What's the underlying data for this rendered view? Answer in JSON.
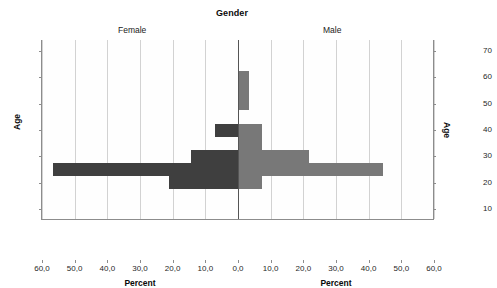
{
  "chart_data": {
    "type": "bar",
    "title": "Gender",
    "subtype": "population-pyramid",
    "panels": [
      {
        "name": "female",
        "label": "Female",
        "side": "left",
        "color": "#3f3f3f"
      },
      {
        "name": "male",
        "label": "Male",
        "side": "right",
        "color": "#787878"
      }
    ],
    "xlabel": "Percent",
    "ylabel": "Age",
    "xlabel_left": "Percent",
    "xlabel_right": "Percent",
    "ylabel_left": "Age",
    "ylabel_right": "Age",
    "xlim": [
      0,
      60
    ],
    "ylim": [
      10,
      70
    ],
    "grid": true,
    "legend_position": "none",
    "decimal_separator": ",",
    "xticks_left": [
      "60,0",
      "50,0",
      "40,0",
      "30,0",
      "20,0",
      "10,0",
      "0,0"
    ],
    "xticks_right": [
      "0,0",
      "10,0",
      "20,0",
      "30,0",
      "40,0",
      "50,0",
      "60,0"
    ],
    "xtick_values_left": [
      60,
      50,
      40,
      30,
      20,
      10,
      0
    ],
    "xtick_values_right": [
      0,
      10,
      20,
      30,
      40,
      50,
      60
    ],
    "yticks": [
      "70",
      "60",
      "50",
      "40",
      "30",
      "20",
      "10"
    ],
    "ytick_values": [
      70,
      60,
      50,
      40,
      30,
      20,
      10
    ],
    "series": [
      {
        "name": "Female",
        "side": "left",
        "color": "#3f3f3f",
        "points": [
          {
            "age": 40,
            "percent": 7.0
          },
          {
            "age": 30,
            "percent": 14.5
          },
          {
            "age": 25,
            "percent": 56.5
          },
          {
            "age": 20,
            "percent": 21.0
          }
        ]
      },
      {
        "name": "Male",
        "side": "right",
        "color": "#787878",
        "points": [
          {
            "age": 60,
            "percent": 3.0
          },
          {
            "age": 55,
            "percent": 3.0
          },
          {
            "age": 50,
            "percent": 3.0
          },
          {
            "age": 40,
            "percent": 7.0
          },
          {
            "age": 35,
            "percent": 7.0
          },
          {
            "age": 30,
            "percent": 21.5
          },
          {
            "age": 25,
            "percent": 44.0
          },
          {
            "age": 20,
            "percent": 7.0
          }
        ]
      }
    ]
  }
}
